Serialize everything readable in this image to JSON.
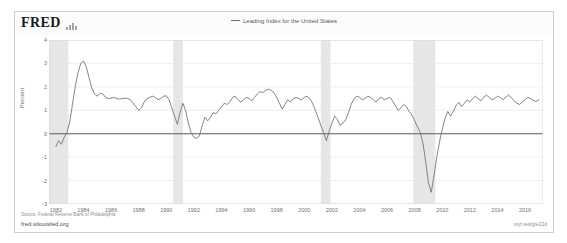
{
  "card": {
    "brand": "FRED",
    "brand_mark": "bar-chart-icon"
  },
  "legend": {
    "label": "Leading Index for the United States",
    "line_color": "#6b7883"
  },
  "footer": {
    "source": "Source: Federal Reserve Bank of Philadelphia",
    "url": "fred.stlouisfed.org",
    "shortlink": "myf.red/g/e22d"
  },
  "chart_data": {
    "type": "line",
    "title": "",
    "xlabel": "",
    "ylabel": "Percent",
    "ylim": [
      -3,
      4
    ],
    "xlim": [
      1981.5,
      2017.3
    ],
    "grid": true,
    "legend_position": "top-center",
    "yticks": [
      4,
      3,
      2,
      1,
      0,
      -1,
      -2,
      -3
    ],
    "xticks": [
      1982,
      1984,
      1986,
      1988,
      1990,
      1992,
      1994,
      1996,
      1998,
      2000,
      2002,
      2004,
      2006,
      2008,
      2010,
      2012,
      2014,
      2016
    ],
    "zero_line": 0,
    "line_color": "#6b7883",
    "recession_color": "#e6e6e6",
    "recession_bands": [
      {
        "start": 1981.5,
        "end": 1982.9
      },
      {
        "start": 1990.5,
        "end": 1991.2
      },
      {
        "start": 2001.2,
        "end": 2001.9
      },
      {
        "start": 2007.9,
        "end": 2009.5
      }
    ],
    "series": [
      {
        "name": "Leading Index for the United States",
        "x": [
          1982.0,
          1982.2,
          1982.4,
          1982.6,
          1982.8,
          1983.0,
          1983.2,
          1983.4,
          1983.6,
          1983.8,
          1984.0,
          1984.2,
          1984.4,
          1984.6,
          1984.8,
          1985.0,
          1985.2,
          1985.4,
          1985.6,
          1985.8,
          1986.0,
          1986.2,
          1986.4,
          1986.6,
          1986.8,
          1987.0,
          1987.2,
          1987.4,
          1987.6,
          1987.8,
          1988.0,
          1988.2,
          1988.4,
          1988.6,
          1988.8,
          1989.0,
          1989.2,
          1989.4,
          1989.6,
          1989.8,
          1990.0,
          1990.2,
          1990.4,
          1990.6,
          1990.8,
          1991.0,
          1991.2,
          1991.4,
          1991.6,
          1991.8,
          1992.0,
          1992.2,
          1992.4,
          1992.6,
          1992.8,
          1993.0,
          1993.2,
          1993.4,
          1993.6,
          1993.8,
          1994.0,
          1994.2,
          1994.4,
          1994.6,
          1994.8,
          1995.0,
          1995.2,
          1995.4,
          1995.6,
          1995.8,
          1996.0,
          1996.2,
          1996.4,
          1996.6,
          1996.8,
          1997.0,
          1997.2,
          1997.4,
          1997.6,
          1997.8,
          1998.0,
          1998.2,
          1998.4,
          1998.6,
          1998.8,
          1999.0,
          1999.2,
          1999.4,
          1999.6,
          1999.8,
          2000.0,
          2000.2,
          2000.4,
          2000.6,
          2000.8,
          2001.0,
          2001.2,
          2001.4,
          2001.6,
          2001.8,
          2002.0,
          2002.2,
          2002.4,
          2002.6,
          2002.8,
          2003.0,
          2003.2,
          2003.4,
          2003.6,
          2003.8,
          2004.0,
          2004.2,
          2004.4,
          2004.6,
          2004.8,
          2005.0,
          2005.2,
          2005.4,
          2005.6,
          2005.8,
          2006.0,
          2006.2,
          2006.4,
          2006.6,
          2006.8,
          2007.0,
          2007.2,
          2007.4,
          2007.6,
          2007.8,
          2008.0,
          2008.2,
          2008.4,
          2008.6,
          2008.8,
          2009.0,
          2009.2,
          2009.4,
          2009.6,
          2009.8,
          2010.0,
          2010.2,
          2010.4,
          2010.6,
          2010.8,
          2011.0,
          2011.2,
          2011.4,
          2011.6,
          2011.8,
          2012.0,
          2012.2,
          2012.4,
          2012.6,
          2012.8,
          2013.0,
          2013.2,
          2013.4,
          2013.6,
          2013.8,
          2014.0,
          2014.2,
          2014.4,
          2014.6,
          2014.8,
          2015.0,
          2015.2,
          2015.4,
          2015.6,
          2015.8,
          2016.0,
          2016.2,
          2016.4,
          2016.6,
          2016.8,
          2017.0
        ],
        "values": [
          -0.55,
          -0.3,
          -0.45,
          -0.15,
          0.05,
          0.5,
          1.25,
          2.0,
          2.6,
          3.0,
          3.1,
          2.85,
          2.4,
          1.95,
          1.7,
          1.6,
          1.72,
          1.7,
          1.55,
          1.5,
          1.52,
          1.55,
          1.5,
          1.48,
          1.5,
          1.52,
          1.5,
          1.45,
          1.3,
          1.15,
          1.0,
          1.1,
          1.35,
          1.5,
          1.55,
          1.6,
          1.55,
          1.45,
          1.5,
          1.6,
          1.62,
          1.45,
          1.1,
          0.75,
          0.4,
          0.9,
          1.3,
          1.0,
          0.45,
          0.05,
          -0.15,
          -0.2,
          -0.1,
          0.35,
          0.7,
          0.55,
          0.7,
          0.9,
          0.85,
          1.0,
          1.15,
          1.3,
          1.25,
          1.35,
          1.55,
          1.6,
          1.45,
          1.35,
          1.45,
          1.55,
          1.5,
          1.4,
          1.55,
          1.7,
          1.8,
          1.75,
          1.85,
          1.9,
          1.85,
          1.75,
          1.55,
          1.3,
          1.05,
          1.25,
          1.45,
          1.35,
          1.5,
          1.55,
          1.5,
          1.45,
          1.55,
          1.6,
          1.5,
          1.3,
          1.0,
          0.7,
          0.35,
          0.05,
          -0.3,
          0.1,
          0.45,
          0.75,
          0.6,
          0.35,
          0.45,
          0.6,
          0.9,
          1.25,
          1.5,
          1.6,
          1.55,
          1.45,
          1.5,
          1.6,
          1.55,
          1.45,
          1.35,
          1.5,
          1.55,
          1.45,
          1.5,
          1.55,
          1.4,
          1.2,
          1.0,
          1.1,
          1.25,
          1.15,
          0.95,
          0.8,
          0.55,
          0.3,
          0.05,
          -0.4,
          -1.2,
          -2.1,
          -2.5,
          -1.8,
          -1.0,
          -0.35,
          0.2,
          0.65,
          0.95,
          0.75,
          0.95,
          1.2,
          1.35,
          1.15,
          1.3,
          1.45,
          1.35,
          1.5,
          1.6,
          1.5,
          1.4,
          1.55,
          1.65,
          1.55,
          1.45,
          1.5,
          1.6,
          1.55,
          1.45,
          1.55,
          1.65,
          1.55,
          1.4,
          1.3,
          1.25,
          1.35,
          1.45,
          1.55,
          1.5,
          1.42,
          1.38,
          1.45
        ]
      }
    ]
  }
}
